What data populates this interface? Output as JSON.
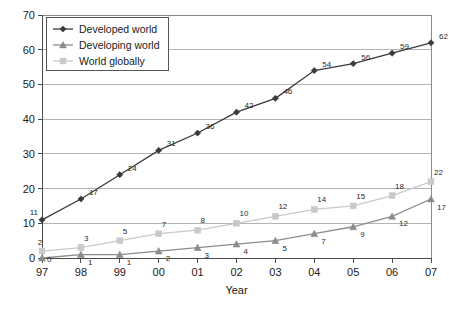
{
  "chart_data": {
    "type": "line",
    "title": "",
    "xlabel": "Year",
    "ylabel": "",
    "categories": [
      "97",
      "98",
      "99",
      "00",
      "01",
      "02",
      "03",
      "04",
      "05",
      "06",
      "07"
    ],
    "ylim": [
      0,
      70
    ],
    "ytick_step": 10,
    "yticks": [
      "0",
      "10",
      "20",
      "30",
      "40",
      "50",
      "60",
      "70"
    ],
    "grid": "horizontal",
    "legend_position": "top-left",
    "show_data_labels": true,
    "series": [
      {
        "name": "Developed world",
        "marker": "diamond",
        "color": "#3a3a3a",
        "values": [
          11,
          17,
          24,
          31,
          36,
          42,
          46,
          54,
          56,
          59,
          62
        ]
      },
      {
        "name": "Developing world",
        "marker": "triangle",
        "color": "#8c8c8c",
        "values": [
          0,
          1,
          1,
          2,
          3,
          4,
          5,
          7,
          9,
          12,
          17
        ]
      },
      {
        "name": "World globally",
        "marker": "square",
        "color": "#c9c9c9",
        "values": [
          2,
          3,
          5,
          7,
          8,
          10,
          12,
          14,
          15,
          18,
          22
        ]
      }
    ]
  },
  "legend": {
    "items": [
      {
        "label": "Developed world"
      },
      {
        "label": "Developing world"
      },
      {
        "label": "World globally"
      }
    ]
  },
  "axes": {
    "x_title": "Year",
    "y_title": ""
  }
}
